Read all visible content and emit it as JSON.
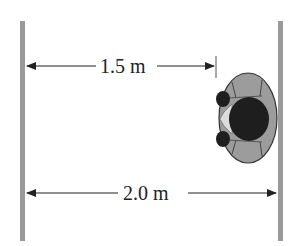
{
  "diagram": {
    "labels": {
      "distance_to_person": "1.5 m",
      "distance_between_walls": "2.0 m"
    },
    "elements": {
      "left_wall": "wall",
      "right_wall": "wall",
      "person": "person viewed from above"
    },
    "colors": {
      "wall": "#9a9a9a",
      "arrow": "#222222",
      "body": "#9c9c9c",
      "hair": "#1e1e1e",
      "face": "#dcdcdc"
    }
  }
}
